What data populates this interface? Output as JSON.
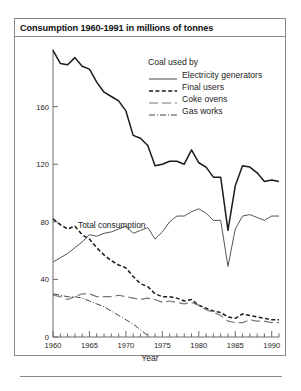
{
  "figure": {
    "title": "Consumption 1960-1991 in millions of tonnes",
    "annotation_total": "Total consumption",
    "xlabel": "Year"
  },
  "legend": {
    "title": "Coal used by",
    "entries": [
      {
        "label": "Electricity generators",
        "style": "solid",
        "color": "#555555"
      },
      {
        "label": "Final users",
        "style": "dashed",
        "color": "#1a1a1a"
      },
      {
        "label": "Coke ovens",
        "style": "longdash",
        "color": "#777777"
      },
      {
        "label": "Gas works",
        "style": "dashdot",
        "color": "#444444"
      }
    ]
  },
  "chart_data": {
    "type": "line",
    "title": "Consumption 1960-1991 in millions of tonnes",
    "xlabel": "Year",
    "ylabel": "",
    "xlim": [
      1960,
      1991
    ],
    "ylim": [
      0,
      200
    ],
    "yticks": [
      0,
      40,
      80,
      120,
      160
    ],
    "ytick_labels": [
      "0",
      "40",
      "80",
      "120",
      "160"
    ],
    "xticks": [
      1960,
      1965,
      1970,
      1975,
      1980,
      1985,
      1990
    ],
    "xtick_labels": [
      "1960",
      "1965",
      "1970",
      "1975",
      "1980",
      "1985",
      "1990"
    ],
    "minor_xticks": "every year",
    "grid": false,
    "legend_position": "top-right inside",
    "annotations": [
      {
        "text": "Total consumption",
        "x": 1964.5,
        "y": 103
      }
    ],
    "x": [
      1960,
      1961,
      1962,
      1963,
      1964,
      1965,
      1966,
      1967,
      1968,
      1969,
      1970,
      1971,
      1972,
      1973,
      1974,
      1975,
      1976,
      1977,
      1978,
      1979,
      1980,
      1981,
      1982,
      1983,
      1984,
      1985,
      1986,
      1987,
      1988,
      1989,
      1990,
      1991
    ],
    "series": [
      {
        "name": "Total consumption",
        "style": "solid-black",
        "color": "#1a1a1a",
        "values": [
          199,
          190,
          189,
          194,
          188,
          186,
          177,
          170,
          167,
          164,
          157,
          140,
          138,
          133,
          119,
          120,
          122,
          122,
          120,
          130,
          121,
          118,
          111,
          111,
          74,
          105,
          119,
          118,
          114,
          108,
          109,
          108
        ]
      },
      {
        "name": "Electricity generators",
        "style": "solid",
        "color": "#555555",
        "values": [
          52,
          55,
          58,
          62,
          66,
          71,
          70,
          72,
          73,
          75,
          77,
          72,
          74,
          76,
          68,
          73,
          80,
          84,
          84,
          87,
          89,
          86,
          81,
          81,
          49,
          75,
          84,
          85,
          83,
          81,
          84,
          84
        ]
      },
      {
        "name": "Final users",
        "style": "dashed",
        "color": "#1a1a1a",
        "values": [
          82,
          78,
          75,
          77,
          71,
          68,
          62,
          57,
          53,
          50,
          48,
          42,
          37,
          35,
          30,
          28,
          28,
          27,
          25,
          26,
          22,
          20,
          18,
          17,
          14,
          13,
          16,
          15,
          14,
          13,
          12,
          12
        ]
      },
      {
        "name": "Coke ovens",
        "style": "longdash",
        "color": "#777777",
        "values": [
          29,
          28,
          26,
          28,
          30,
          30,
          28,
          28,
          28,
          29,
          28,
          27,
          26,
          27,
          26,
          24,
          25,
          24,
          23,
          24,
          22,
          19,
          17,
          15,
          11,
          10,
          10,
          12,
          11,
          11,
          10,
          10
        ]
      },
      {
        "name": "Gas works",
        "style": "dashdot",
        "color": "#444444",
        "values": [
          30,
          29,
          28,
          28,
          27,
          25,
          23,
          21,
          18,
          15,
          12,
          9,
          5,
          1,
          0,
          0,
          0,
          0,
          0,
          0,
          0,
          0,
          0,
          0,
          0,
          0,
          0,
          0,
          0,
          0,
          0,
          0
        ]
      }
    ]
  }
}
